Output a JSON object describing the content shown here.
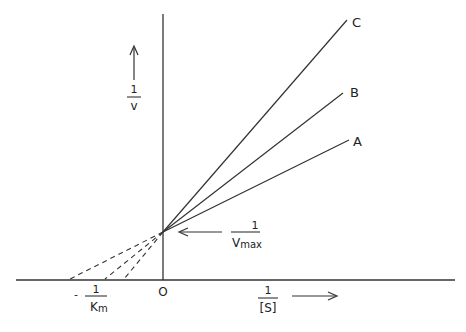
{
  "diagram": {
    "y_axis": {
      "numerator": "1",
      "denominator": "v"
    },
    "x_axis": {
      "numerator": "1",
      "denominator": "[S]"
    },
    "origin_label": "O",
    "x_intercept_label": {
      "sign": "-",
      "numerator": "1",
      "denominator": "K",
      "subscript": "m"
    },
    "y_intercept_label": {
      "numerator": "1",
      "denominator": "V",
      "subscript": "max"
    },
    "lines": [
      {
        "label": "A"
      },
      {
        "label": "B"
      },
      {
        "label": "C"
      }
    ]
  }
}
